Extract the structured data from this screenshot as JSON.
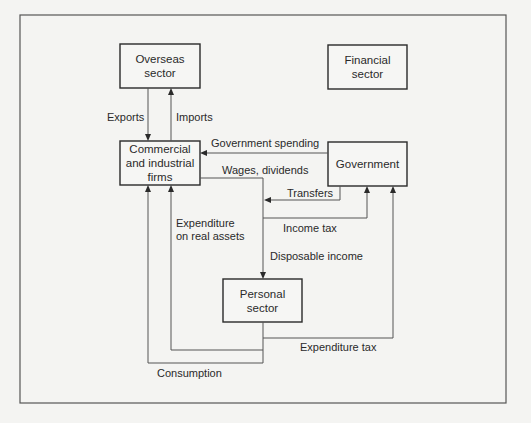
{
  "diagram": {
    "nodes": [
      {
        "id": "overseas",
        "label": "Overseas\nsector"
      },
      {
        "id": "financial",
        "label": "Financial\nsector"
      },
      {
        "id": "commercial",
        "label": "Commercial\nand industrial\nfirms"
      },
      {
        "id": "government",
        "label": "Government"
      },
      {
        "id": "personal",
        "label": "Personal\nsector"
      }
    ],
    "flows": [
      {
        "id": "exports",
        "label": "Exports",
        "from": "overseas",
        "to": "commercial"
      },
      {
        "id": "imports",
        "label": "Imports",
        "from": "commercial",
        "to": "overseas"
      },
      {
        "id": "government_spending",
        "label": "Government spending",
        "from": "government",
        "to": "commercial"
      },
      {
        "id": "wages_dividends",
        "label": "Wages, dividends",
        "from": "commercial",
        "to": "personal"
      },
      {
        "id": "transfers",
        "label": "Transfers",
        "from": "government",
        "to": "personal"
      },
      {
        "id": "income_tax",
        "label": "Income tax",
        "from": "personal",
        "to": "government"
      },
      {
        "id": "disposable_income",
        "label": "Disposable income",
        "from": "commercial",
        "to": "personal"
      },
      {
        "id": "expenditure_real_assets",
        "label": "Expenditure\non real assets",
        "from": "personal",
        "to": "commercial"
      },
      {
        "id": "expenditure_tax",
        "label": "Expenditure tax",
        "from": "personal",
        "to": "government"
      },
      {
        "id": "consumption",
        "label": "Consumption",
        "from": "personal",
        "to": "commercial"
      }
    ]
  }
}
